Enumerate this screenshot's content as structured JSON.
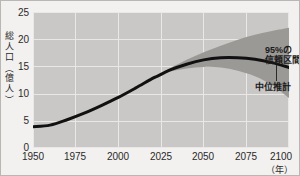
{
  "chart_data": {
    "type": "line",
    "title": "",
    "xlabel": "（年）",
    "ylabel": "総人口（億人）",
    "xlim": [
      1950,
      2100
    ],
    "ylim": [
      0,
      25
    ],
    "grid": true,
    "x_ticks": [
      "1950",
      "1975",
      "2000",
      "2025",
      "2050",
      "2075",
      "2100"
    ],
    "x_tick_values": [
      1950,
      1975,
      2000,
      2025,
      2050,
      2075,
      2100
    ],
    "y_ticks": [
      "0",
      "5",
      "10",
      "15",
      "20",
      "25"
    ],
    "y_tick_values": [
      0,
      5,
      10,
      15,
      20,
      25
    ],
    "series": [
      {
        "name": "中位推計",
        "type": "line",
        "color": "#111111",
        "x": [
          1950,
          1960,
          1970,
          1980,
          1990,
          2000,
          2010,
          2020,
          2023,
          2030,
          2040,
          2050,
          2060,
          2070,
          2080,
          2090,
          2100
        ],
        "values": [
          3.9,
          4.2,
          5.2,
          6.4,
          7.8,
          9.3,
          11.0,
          12.8,
          13.2,
          14.3,
          15.4,
          16.2,
          16.6,
          16.6,
          16.3,
          15.7,
          14.8
        ]
      },
      {
        "name": "95%の信頼区間",
        "type": "band",
        "color": "#9a9996",
        "x": [
          2023,
          2030,
          2040,
          2050,
          2060,
          2070,
          2080,
          2090,
          2100
        ],
        "upper": [
          13.3,
          14.6,
          16.2,
          17.6,
          18.8,
          19.9,
          20.8,
          21.5,
          22.1
        ],
        "lower": [
          13.1,
          14.0,
          14.6,
          14.9,
          14.8,
          14.2,
          13.2,
          11.6,
          9.2
        ]
      }
    ],
    "annotations": [
      {
        "name": "confidence-interval",
        "text_lines": [
          "95%の",
          "信頼区間"
        ],
        "x": 2085,
        "y": 20.3
      },
      {
        "name": "median-projection",
        "text_lines": [
          "中位推計"
        ],
        "x": 2078,
        "y": 13.3
      }
    ],
    "colors": {
      "plot_background": "#c9c8c6",
      "page_background": "#f2f1ef",
      "grid": "#e9e8e6",
      "band": "#9a9996",
      "line": "#111111",
      "text": "#2a2a2a",
      "border": "#b9b7b3"
    }
  },
  "axes": {
    "y_title_chars": [
      "総",
      "人",
      "口",
      "（",
      "億",
      "人",
      "）"
    ],
    "x_unit_label": "（年）"
  },
  "annotations": {
    "ci_line1": "95%の",
    "ci_line2": "信頼区間",
    "median": "中位推計"
  }
}
